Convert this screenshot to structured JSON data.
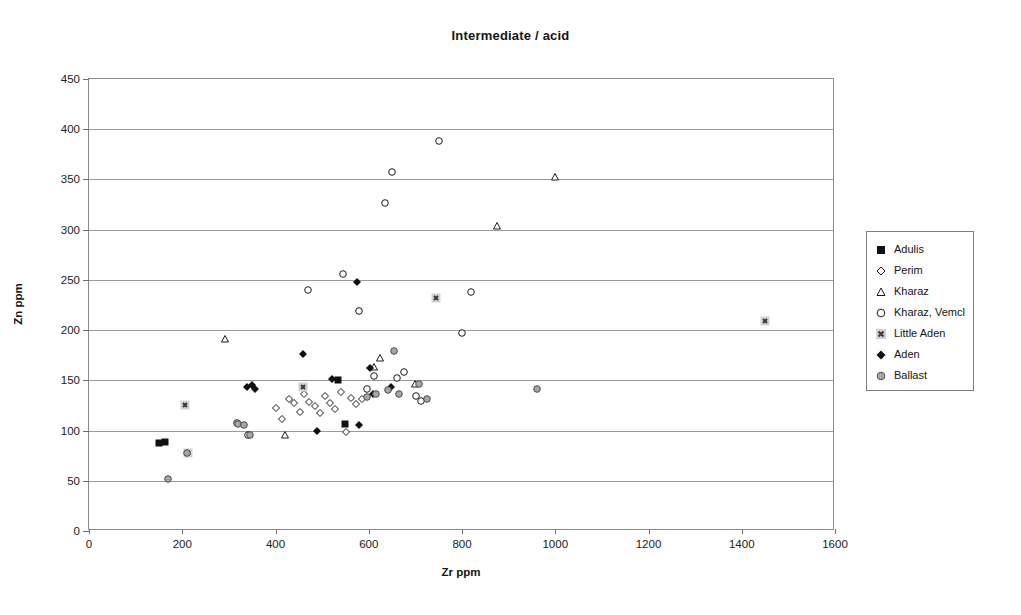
{
  "chart_data": {
    "type": "scatter",
    "title": "Intermediate / acid",
    "xlabel": "Zr ppm",
    "ylabel": "Zn ppm",
    "xlim": [
      0,
      1600
    ],
    "ylim": [
      0,
      450
    ],
    "xticks": [
      0,
      200,
      400,
      600,
      800,
      1000,
      1200,
      1400,
      1600
    ],
    "yticks": [
      0,
      50,
      100,
      150,
      200,
      250,
      300,
      350,
      400,
      450
    ],
    "grid": "horizontal",
    "legend_position": "right-outside",
    "series": [
      {
        "name": "Adulis",
        "marker": "filled-square",
        "color": "#111111",
        "points": [
          [
            150,
            88
          ],
          [
            162,
            89
          ],
          [
            535,
            150
          ],
          [
            548,
            107
          ]
        ]
      },
      {
        "name": "Perim",
        "marker": "open-diamond",
        "color": "#1a1a1a",
        "points": [
          [
            400,
            122
          ],
          [
            415,
            112
          ],
          [
            428,
            131
          ],
          [
            440,
            127
          ],
          [
            452,
            118
          ],
          [
            462,
            136
          ],
          [
            472,
            128
          ],
          [
            484,
            124
          ],
          [
            496,
            117
          ],
          [
            506,
            134
          ],
          [
            516,
            127
          ],
          [
            528,
            121
          ],
          [
            540,
            138
          ],
          [
            551,
            99
          ],
          [
            561,
            132
          ],
          [
            572,
            126
          ],
          [
            586,
            131
          ]
        ]
      },
      {
        "name": "Kharaz",
        "marker": "open-triangle",
        "color": "#1a1a1a",
        "points": [
          [
            291,
            191
          ],
          [
            420,
            96
          ],
          [
            611,
            163
          ],
          [
            625,
            172
          ],
          [
            700,
            146
          ],
          [
            875,
            304
          ],
          [
            1000,
            352
          ]
        ]
      },
      {
        "name": "Kharaz, Vemcl",
        "marker": "open-circle",
        "color": "#1a1a1a",
        "points": [
          [
            317,
            108
          ],
          [
            341,
            96
          ],
          [
            470,
            240
          ],
          [
            545,
            256
          ],
          [
            580,
            219
          ],
          [
            596,
            141
          ],
          [
            612,
            154
          ],
          [
            635,
            327
          ],
          [
            650,
            357
          ],
          [
            661,
            152
          ],
          [
            676,
            158
          ],
          [
            702,
            134
          ],
          [
            713,
            129
          ],
          [
            750,
            388
          ],
          [
            800,
            197
          ],
          [
            820,
            238
          ]
        ]
      },
      {
        "name": "Little Aden",
        "marker": "x-in-square",
        "color": "#8c8c8c",
        "points": [
          [
            206,
            125
          ],
          [
            213,
            78
          ],
          [
            460,
            143
          ],
          [
            745,
            232
          ],
          [
            1450,
            209
          ]
        ]
      },
      {
        "name": "Aden",
        "marker": "filled-diamond",
        "color": "#111111",
        "points": [
          [
            338,
            143
          ],
          [
            350,
            145
          ],
          [
            356,
            141
          ],
          [
            458,
            176
          ],
          [
            490,
            100
          ],
          [
            522,
            151
          ],
          [
            575,
            248
          ],
          [
            580,
            106
          ],
          [
            602,
            162
          ],
          [
            610,
            136
          ],
          [
            648,
            143
          ]
        ]
      },
      {
        "name": "Ballast",
        "marker": "gray-circle",
        "color": "#a6a6a6",
        "points": [
          [
            170,
            52
          ],
          [
            210,
            78
          ],
          [
            320,
            107
          ],
          [
            332,
            106
          ],
          [
            346,
            96
          ],
          [
            596,
            133
          ],
          [
            615,
            136
          ],
          [
            641,
            140
          ],
          [
            655,
            179
          ],
          [
            665,
            136
          ],
          [
            707,
            146
          ],
          [
            724,
            131
          ],
          [
            960,
            141
          ]
        ]
      }
    ]
  }
}
